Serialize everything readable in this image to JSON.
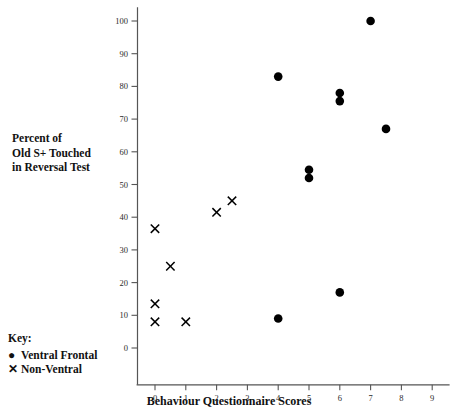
{
  "figure": {
    "ylabel_lines": [
      "Percent of",
      "Old S+ Touched",
      "in Reversal Test"
    ],
    "xlabel": "Behaviour Questionnaire Scores",
    "key_heading": "Key:",
    "axis_color": "#555555",
    "marker_color": "#000000"
  },
  "legend": {
    "items": [
      {
        "symbol": "●",
        "label": "Ventral Frontal",
        "icon": "filled-circle-marker"
      },
      {
        "symbol": "✕",
        "label": "Non-Ventral",
        "icon": "cross-marker"
      }
    ]
  },
  "chart_data": {
    "type": "scatter",
    "title": "",
    "xlabel": "Behaviour Questionnaire Scores",
    "ylabel": "Percent of Old S+ Touched in Reversal Test",
    "xlim": [
      -0.5,
      9.5
    ],
    "ylim": [
      -3,
      103
    ],
    "xticks": [
      0,
      1,
      2,
      3,
      4,
      5,
      6,
      7,
      8,
      9
    ],
    "xticklabels": [
      "0",
      "1",
      "2",
      "3",
      "4",
      "5",
      "6",
      "7",
      "8",
      "9"
    ],
    "yticks": [
      0,
      10,
      20,
      30,
      40,
      50,
      60,
      70,
      80,
      90,
      100
    ],
    "yticklabels": [
      "0",
      "10",
      "20",
      "30",
      "40",
      "50",
      "60",
      "70",
      "80",
      "90",
      "100"
    ],
    "grid": false,
    "legend_position": "outside-bottom-left",
    "series": [
      {
        "name": "Ventral Frontal",
        "marker": "circle",
        "color": "#000000",
        "points": [
          {
            "x": 4,
            "y": 83
          },
          {
            "x": 4,
            "y": 9
          },
          {
            "x": 5,
            "y": 54.5
          },
          {
            "x": 5,
            "y": 52
          },
          {
            "x": 6,
            "y": 78
          },
          {
            "x": 6,
            "y": 75.5
          },
          {
            "x": 6,
            "y": 17
          },
          {
            "x": 7,
            "y": 100
          },
          {
            "x": 7.5,
            "y": 67
          }
        ]
      },
      {
        "name": "Non-Ventral",
        "marker": "x",
        "color": "#000000",
        "points": [
          {
            "x": 0,
            "y": 36.5
          },
          {
            "x": 0,
            "y": 13.5
          },
          {
            "x": 0,
            "y": 8
          },
          {
            "x": 0.5,
            "y": 25
          },
          {
            "x": 1,
            "y": 8
          },
          {
            "x": 2,
            "y": 41.5
          },
          {
            "x": 2.5,
            "y": 45
          }
        ]
      }
    ]
  }
}
